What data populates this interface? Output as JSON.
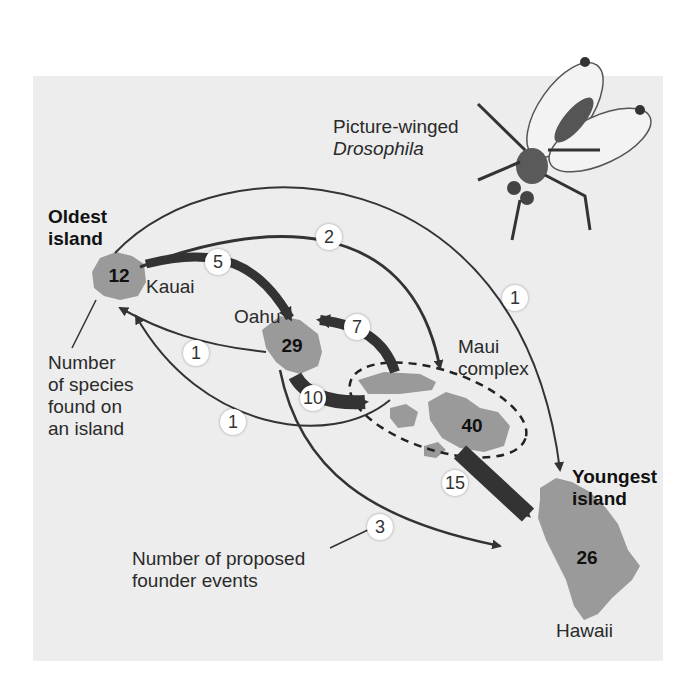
{
  "fly_label": {
    "line1": "Picture-winged",
    "line2": "Drosophila"
  },
  "oldest_label": {
    "line1": "Oldest",
    "line2": "island"
  },
  "youngest_label": {
    "line1": "Youngest",
    "line2": "island"
  },
  "species_caption": {
    "line1": "Number",
    "line2": "of species",
    "line3": "found on",
    "line4": "an island"
  },
  "founder_caption": {
    "line1": "Number of proposed",
    "line2": "founder events"
  },
  "islands": {
    "kauai": {
      "name": "Kauai",
      "species": "12"
    },
    "oahu": {
      "name": "Oahu",
      "species": "29"
    },
    "maui": {
      "name_line1": "Maui",
      "name_line2": "complex",
      "species": "40"
    },
    "hawaii": {
      "name": "Hawaii",
      "species": "26"
    }
  },
  "founder_events": {
    "kauai_to_oahu": "5",
    "kauai_to_maui": "2",
    "kauai_to_hawaii": "1",
    "oahu_to_kauai": "1",
    "maui_to_kauai": "1",
    "maui_to_oahu": "7",
    "oahu_to_maui": "10",
    "maui_to_hawaii": "15",
    "oahu_to_hawaii": "3"
  },
  "colors": {
    "panel": "#ededed",
    "island": "#9a9a9a",
    "arrow": "#333333",
    "text": "#2a2a2a"
  }
}
